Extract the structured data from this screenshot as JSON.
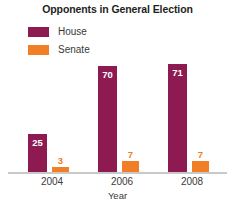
{
  "chart_data": {
    "type": "bar",
    "title": "Opponents in General Election",
    "xlabel": "Year",
    "ylabel": "",
    "categories": [
      "2004",
      "2006",
      "2008"
    ],
    "series": [
      {
        "name": "House",
        "color": "#8e1a52",
        "values": [
          25,
          70,
          71
        ]
      },
      {
        "name": "Senate",
        "color": "#f07f28",
        "values": [
          3,
          7,
          7
        ]
      }
    ],
    "value_labels": {
      "house": [
        "25",
        "70",
        "71"
      ],
      "senate": [
        "3",
        "7",
        "7"
      ]
    },
    "ylim": [
      0,
      75
    ],
    "grid": false,
    "legend_position": "top-left",
    "legend_entries": [
      "House",
      "Senate"
    ]
  },
  "colors": {
    "house": "#8e1a52",
    "senate": "#f07f28",
    "baseline": "#c9c9c9",
    "text": "#3a3a3a",
    "title": "#231f20",
    "value_inside": "#ffffff"
  },
  "legend": {
    "items": [
      {
        "label": "House"
      },
      {
        "label": "Senate"
      }
    ]
  },
  "axis": {
    "ticks": [
      "2004",
      "2006",
      "2008"
    ],
    "title": "Year"
  }
}
